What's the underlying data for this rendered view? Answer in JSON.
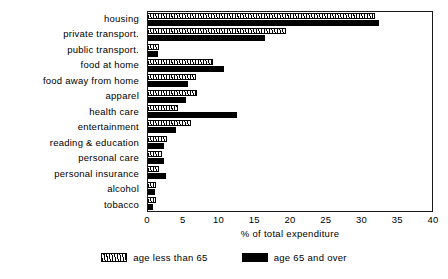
{
  "chart_data": {
    "type": "bar",
    "orientation": "horizontal",
    "title": "",
    "xlabel": "% of total expenditure",
    "ylabel": "",
    "xlim": [
      0,
      40
    ],
    "xticks": [
      0,
      5,
      10,
      15,
      20,
      25,
      30,
      35,
      40
    ],
    "grid": false,
    "legend_position": "bottom-center",
    "categories": [
      "housing",
      "private transport.",
      "public transport.",
      "food at home",
      "food away from home",
      "apparel",
      "health care",
      "entertainment",
      "reading & education",
      "personal care",
      "personal insurance",
      "alcohol",
      "tobacco"
    ],
    "series": [
      {
        "name": "age less than 65",
        "pattern": "hatched",
        "color": "#000000",
        "values": [
          32.0,
          19.4,
          1.5,
          9.1,
          6.7,
          6.9,
          4.2,
          6.0,
          2.7,
          2.0,
          1.6,
          1.1,
          1.1
        ]
      },
      {
        "name": "age 65 and over",
        "pattern": "solid",
        "color": "#000000",
        "values": [
          32.6,
          16.5,
          1.4,
          10.7,
          5.7,
          5.3,
          12.6,
          3.9,
          2.2,
          2.2,
          2.5,
          1.0,
          0.7
        ]
      }
    ]
  },
  "legend": {
    "items": [
      {
        "label": "age less than 65",
        "swatch": "hatched"
      },
      {
        "label": "age 65 and over",
        "swatch": "solid"
      }
    ]
  }
}
